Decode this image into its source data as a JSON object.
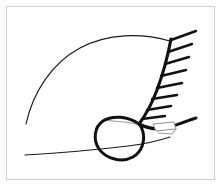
{
  "figure": {
    "width": 222,
    "height": 187,
    "background_color": "#ffffff",
    "border_color": "#cfcfcf",
    "ink_color": "#111111",
    "annotation_color": "#9a9a9a"
  },
  "strokes": {
    "thin_arc": {
      "name": "upper-thin-arc",
      "path": "M 26,124 C 33,92 52,63 80,48 C 108,33 142,33 170,41",
      "width": 1.15,
      "color": "#1a1a1a"
    },
    "baseline": {
      "name": "lower-thin-baseline",
      "path": "M 25,155 C 60,153 95,150 128,146 C 145,144 158,141 170,137",
      "width": 1.15,
      "color": "#1a1a1a"
    },
    "thick_curve": {
      "name": "thick-hatched-curve",
      "path": "M 171,39 C 168,55 163,74 157,90 C 151,106 145,116 139,124",
      "width": 3.1,
      "color": "#111111"
    },
    "thick_tail": {
      "name": "thick-lower-tail",
      "path": "M 139,124 C 147,128 156,130 165,128 C 176,126 186,121 196,118",
      "width": 3.1,
      "color": "#111111"
    },
    "loop": {
      "name": "closed-loop",
      "path": "M 139,124 C 128,116 112,115 103,121 C 94,127 93,140 99,149 C 106,159 122,163 133,157 C 142,152 145,141 143,132 C 142,128 141,126 139,124 Z",
      "width": 3.0,
      "color": "#111111"
    }
  },
  "hatch_marks": {
    "name": "hatch-tick-marks",
    "count": 8,
    "color": "#111111",
    "width": 2.5,
    "segments": [
      {
        "x1": 171,
        "y1": 40,
        "x2": 196,
        "y2": 31
      },
      {
        "x1": 168,
        "y1": 52,
        "x2": 192,
        "y2": 44
      },
      {
        "x1": 165,
        "y1": 64,
        "x2": 189,
        "y2": 57
      },
      {
        "x1": 161,
        "y1": 76,
        "x2": 186,
        "y2": 70
      },
      {
        "x1": 157,
        "y1": 88,
        "x2": 182,
        "y2": 83
      },
      {
        "x1": 152,
        "y1": 99,
        "x2": 177,
        "y2": 95
      },
      {
        "x1": 147,
        "y1": 110,
        "x2": 171,
        "y2": 106
      },
      {
        "x1": 142,
        "y1": 119,
        "x2": 165,
        "y2": 116
      }
    ]
  },
  "annotations": {
    "gray_tie_line": {
      "name": "gray-tie-line",
      "path": "M 103,120 C 118,121 133,123 148,126",
      "color": "#9a9a9a"
    },
    "gray_box": {
      "name": "gray-callout-box",
      "points": "153,124 174,122 176,129 156,131",
      "color": "#8f8f8f",
      "fill": "#ffffff"
    },
    "gray_box_tail": {
      "name": "gray-callout-tail",
      "path": "M 176,129 L 172,134 L 158,133",
      "color": "#8f8f8f"
    }
  }
}
